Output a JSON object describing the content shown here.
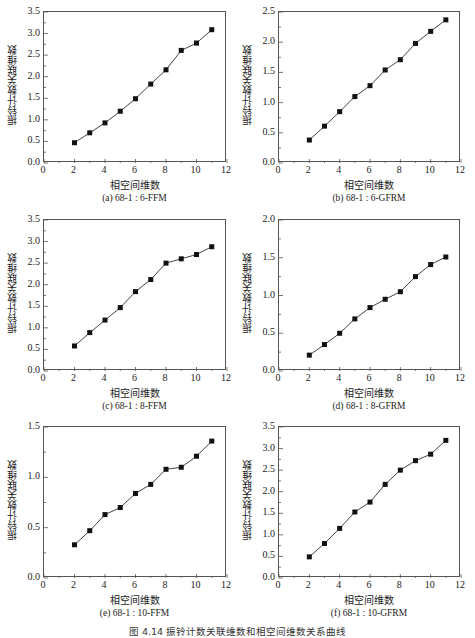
{
  "figure_caption": "图 4.14   振铃计数关联维数和相空间维数关系曲线",
  "chart_data": [
    {
      "id": "a",
      "type": "line",
      "title": "(a)  68-1 : 6-FFM",
      "xlabel": "相空间维数",
      "ylabel": "振铃计数关联维数",
      "x": [
        2,
        3,
        4,
        5,
        6,
        7,
        8,
        9,
        10,
        11
      ],
      "values": [
        0.47,
        0.7,
        0.93,
        1.2,
        1.49,
        1.83,
        2.16,
        2.61,
        2.78,
        3.09
      ],
      "xlim": [
        0,
        12
      ],
      "ylim": [
        0,
        3.5
      ],
      "xticks": [
        "0",
        "2",
        "4",
        "6",
        "8",
        "10",
        "12"
      ],
      "yticks": [
        "0.0",
        "0.5",
        "1.0",
        "1.5",
        "2.0",
        "2.5",
        "3.0",
        "3.5"
      ],
      "marker": "square",
      "grid": false,
      "legend": null
    },
    {
      "id": "b",
      "type": "line",
      "title": "(b)  68-1 : 6-GFRM",
      "xlabel": "相空间维数",
      "ylabel": "振铃计数关联维数",
      "x": [
        2,
        3,
        4,
        5,
        6,
        7,
        8,
        9,
        10,
        11
      ],
      "values": [
        0.38,
        0.61,
        0.85,
        1.1,
        1.28,
        1.54,
        1.71,
        1.98,
        2.18,
        2.37
      ],
      "xlim": [
        0,
        12
      ],
      "ylim": [
        0,
        2.5
      ],
      "xticks": [
        "0",
        "2",
        "4",
        "6",
        "8",
        "10",
        "12"
      ],
      "yticks": [
        "0.0",
        "0.5",
        "1.0",
        "1.5",
        "2.0",
        "2.5"
      ],
      "marker": "square",
      "grid": false,
      "legend": null
    },
    {
      "id": "c",
      "type": "line",
      "title": "(c)  68-1 : 8-FFM",
      "xlabel": "相空间维数",
      "ylabel": "振铃计数关联维数",
      "x": [
        2,
        3,
        4,
        5,
        6,
        7,
        8,
        9,
        10,
        11
      ],
      "values": [
        0.58,
        0.89,
        1.18,
        1.47,
        1.84,
        2.12,
        2.5,
        2.6,
        2.7,
        2.88
      ],
      "xlim": [
        0,
        12
      ],
      "ylim": [
        0,
        3.5
      ],
      "xticks": [
        "0",
        "2",
        "4",
        "6",
        "8",
        "10",
        "12"
      ],
      "yticks": [
        "0.0",
        "0.5",
        "1.0",
        "1.5",
        "2.0",
        "2.5",
        "3.0",
        "3.5"
      ],
      "marker": "square",
      "grid": false,
      "legend": null
    },
    {
      "id": "d",
      "type": "line",
      "title": "(d)  68-1 : 8-GFRM",
      "xlabel": "相空间维数",
      "ylabel": "振铃计数关联维数",
      "x": [
        2,
        3,
        4,
        5,
        6,
        7,
        8,
        9,
        10,
        11
      ],
      "values": [
        0.21,
        0.35,
        0.5,
        0.69,
        0.84,
        0.95,
        1.05,
        1.25,
        1.41,
        1.51
      ],
      "xlim": [
        0,
        12
      ],
      "ylim": [
        0,
        2.0
      ],
      "xticks": [
        "0",
        "2",
        "4",
        "6",
        "8",
        "10",
        "12"
      ],
      "yticks": [
        "0.0",
        "0.5",
        "1.0",
        "1.5",
        "2.0"
      ],
      "marker": "square",
      "grid": false,
      "legend": null
    },
    {
      "id": "e",
      "type": "line",
      "title": "(e)  68-1 : 10-FFM",
      "xlabel": "相空间维数",
      "ylabel": "振铃计数关联维数",
      "x": [
        2,
        3,
        4,
        5,
        6,
        7,
        8,
        9,
        10,
        11
      ],
      "values": [
        0.33,
        0.47,
        0.63,
        0.7,
        0.84,
        0.93,
        1.08,
        1.1,
        1.21,
        1.36
      ],
      "xlim": [
        0,
        12
      ],
      "ylim": [
        0,
        1.5
      ],
      "xticks": [
        "0",
        "2",
        "4",
        "6",
        "8",
        "10",
        "12"
      ],
      "yticks": [
        "0.0",
        "0.5",
        "1.0",
        "1.5"
      ],
      "marker": "square",
      "grid": false,
      "legend": null
    },
    {
      "id": "f",
      "type": "line",
      "title": "(f)  68-1 : 10-GFRM",
      "xlabel": "相空间维数",
      "ylabel": "振铃计数关联维数",
      "x": [
        2,
        3,
        4,
        5,
        6,
        7,
        8,
        9,
        10,
        11
      ],
      "values": [
        0.49,
        0.8,
        1.15,
        1.53,
        1.76,
        2.17,
        2.5,
        2.72,
        2.87,
        3.19
      ],
      "xlim": [
        0,
        12
      ],
      "ylim": [
        0,
        3.5
      ],
      "xticks": [
        "0",
        "2",
        "4",
        "6",
        "8",
        "10",
        "12"
      ],
      "yticks": [
        "0.0",
        "0.5",
        "1.0",
        "1.5",
        "2.0",
        "2.5",
        "3.0",
        "3.5"
      ],
      "marker": "square",
      "grid": false,
      "legend": null
    }
  ],
  "style": {
    "line_color": "#444444",
    "marker_color": "#111111",
    "axis_color": "#555555"
  }
}
